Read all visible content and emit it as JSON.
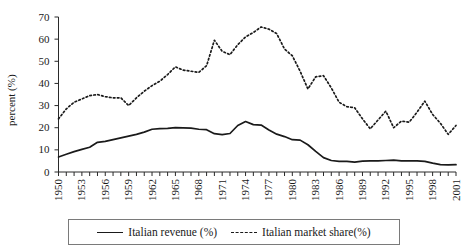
{
  "chart_data": {
    "type": "line",
    "title": "",
    "xlabel": "",
    "ylabel": "percent (%)",
    "ylim": [
      0,
      70
    ],
    "xlim": [
      1950,
      2002
    ],
    "ytick_step": 10,
    "yticks": [
      0,
      10,
      20,
      30,
      40,
      50,
      60,
      70
    ],
    "xtick_labels": [
      "1950",
      "1953",
      "1956",
      "1959",
      "1962",
      "1965",
      "1968",
      "1971",
      "1974",
      "1977",
      "1980",
      "1983",
      "1986",
      "1989",
      "1992",
      "1995",
      "1998",
      "2001"
    ],
    "xtick_label_step": 3,
    "minor_xticks_every": 1,
    "grid": false,
    "legend_position": "below-center",
    "x": [
      1950,
      1951,
      1952,
      1953,
      1954,
      1955,
      1956,
      1957,
      1958,
      1959,
      1960,
      1961,
      1962,
      1963,
      1964,
      1965,
      1966,
      1967,
      1968,
      1969,
      1970,
      1971,
      1972,
      1973,
      1974,
      1975,
      1976,
      1977,
      1978,
      1979,
      1980,
      1981,
      1982,
      1983,
      1984,
      1985,
      1986,
      1987,
      1988,
      1989,
      1990,
      1991,
      1992,
      1993,
      1994,
      1995,
      1996,
      1997,
      1998,
      1999,
      2000,
      2001
    ],
    "series": [
      {
        "name": "Italian revenue (%)",
        "style": "solid",
        "color": "#1a1a1a",
        "values": [
          6.8,
          8.0,
          9.2,
          10.2,
          11.2,
          13.4,
          13.8,
          14.6,
          15.4,
          16.2,
          17.0,
          18.0,
          19.3,
          19.6,
          19.7,
          20.0,
          19.9,
          19.8,
          19.3,
          19.1,
          17.3,
          16.9,
          17.4,
          21.0,
          22.8,
          21.4,
          21.2,
          19.0,
          17.1,
          16.0,
          14.6,
          14.4,
          12.3,
          9.3,
          6.5,
          5.2,
          4.8,
          4.8,
          4.5,
          4.9,
          5.0,
          5.0,
          5.2,
          5.4,
          5.0,
          5.0,
          5.0,
          4.8,
          4.0,
          3.3,
          3.2,
          3.3
        ]
      },
      {
        "name": "Italian market share(%)",
        "style": "dashed",
        "color": "#1a1a1a",
        "values": [
          24.0,
          28.5,
          31.5,
          33.0,
          34.5,
          35.0,
          34.0,
          33.5,
          33.5,
          30.0,
          33.5,
          36.5,
          39.0,
          41.0,
          44.0,
          47.5,
          46.0,
          45.5,
          45.0,
          48.0,
          59.5,
          54.5,
          53.0,
          57.5,
          61.0,
          63.0,
          65.5,
          64.5,
          62.5,
          55.5,
          52.5,
          45.5,
          37.5,
          43.0,
          43.5,
          38.0,
          31.5,
          29.5,
          29.0,
          24.0,
          19.5,
          23.5,
          27.5,
          20.0,
          23.0,
          22.5,
          27.0,
          32.0,
          26.0,
          22.0,
          17.0,
          21.0
        ]
      }
    ]
  },
  "legend": {
    "entries": [
      {
        "label": "Italian revenue (%)",
        "style": "solid"
      },
      {
        "label": "Italian market share(%)",
        "style": "dashed"
      }
    ]
  }
}
